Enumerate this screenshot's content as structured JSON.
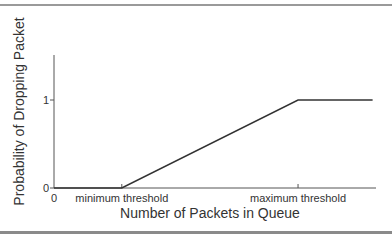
{
  "chart_data": {
    "type": "line",
    "title": "",
    "xlabel": "Number of Packets in Queue",
    "ylabel": "Probability of Dropping Packet",
    "x_tick_labels": [
      "0",
      "minimum threshold",
      "maximum threshold"
    ],
    "y_tick_labels": [
      "0",
      "1"
    ],
    "x_positions": {
      "zero": 0,
      "min_threshold": 1,
      "max_threshold": 3.6,
      "end": 4.7
    },
    "ylim": [
      0,
      1.5
    ],
    "xlim": [
      0,
      4.75
    ],
    "grid": false,
    "series": [
      {
        "name": "drop probability",
        "points": [
          {
            "x": 0,
            "y": 0
          },
          {
            "x": 1,
            "y": 0
          },
          {
            "x": 3.6,
            "y": 1
          },
          {
            "x": 4.7,
            "y": 1
          }
        ]
      }
    ],
    "colors": {
      "line": "#333333",
      "axis": "#555555"
    }
  }
}
